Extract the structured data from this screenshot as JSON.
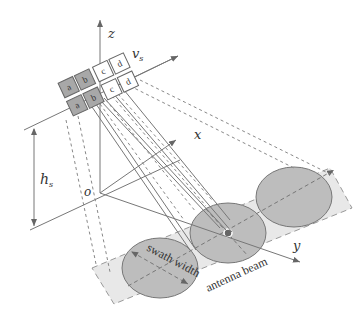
{
  "diagram": {
    "type": "SAR satellite antenna beam geometry",
    "axes": {
      "z": "z",
      "x": "x",
      "y": "y",
      "origin": "o",
      "velocity": "v",
      "velocity_sub": "s",
      "height": "h",
      "height_sub": "s"
    },
    "annotations": {
      "swath_width": "swath width",
      "antenna_beam": "antenna beam"
    },
    "antenna_cells": {
      "top_row": [
        "a",
        "b",
        "c",
        "d"
      ],
      "bottom_row": [
        "a",
        "b",
        "c",
        "d"
      ],
      "shaded": [
        "a",
        "b"
      ]
    },
    "colors": {
      "line": "#666666",
      "ellipse_fill": "#bdbdbd",
      "strip_fill": "#e6e6e6",
      "cell_shaded": "#a8a8a8",
      "cell_plain": "#ffffff"
    }
  }
}
